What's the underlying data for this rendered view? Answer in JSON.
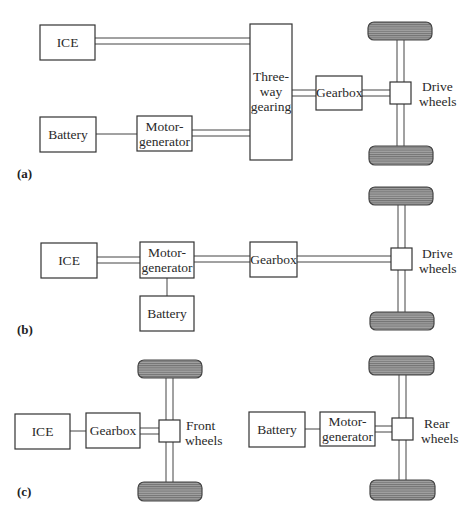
{
  "figure": {
    "panels": [
      {
        "id": "a",
        "label": "(a)",
        "components": {
          "ice": "ICE",
          "battery": "Battery",
          "motor_generator": [
            "Motor-",
            "generator"
          ],
          "three_way_gearing": [
            "Three-",
            "way",
            "gearing"
          ],
          "gearbox": "Gearbox",
          "drive_wheels": [
            "Drive",
            "wheels"
          ]
        },
        "connections": [
          {
            "from": "ICE",
            "to": "Three-way gearing",
            "type": "mechanical (double line)"
          },
          {
            "from": "Battery",
            "to": "Motor-generator",
            "type": "electrical (single line)"
          },
          {
            "from": "Motor-generator",
            "to": "Three-way gearing",
            "type": "mechanical (double line)"
          },
          {
            "from": "Three-way gearing",
            "to": "Gearbox",
            "type": "mechanical (double line)"
          },
          {
            "from": "Gearbox",
            "to": "Drive wheels",
            "type": "mechanical (double line)"
          }
        ]
      },
      {
        "id": "b",
        "label": "(b)",
        "components": {
          "ice": "ICE",
          "motor_generator": [
            "Motor-",
            "generator"
          ],
          "battery": "Battery",
          "gearbox": "Gearbox",
          "drive_wheels": [
            "Drive",
            "wheels"
          ]
        },
        "connections": [
          {
            "from": "ICE",
            "to": "Motor-generator",
            "type": "mechanical (double line)"
          },
          {
            "from": "Motor-generator",
            "to": "Battery",
            "type": "electrical (single line)"
          },
          {
            "from": "Motor-generator",
            "to": "Gearbox",
            "type": "mechanical (double line)"
          },
          {
            "from": "Gearbox",
            "to": "Drive wheels",
            "type": "mechanical (double line)"
          }
        ]
      },
      {
        "id": "c",
        "label": "(c)",
        "components": {
          "ice": "ICE",
          "gearbox": "Gearbox",
          "front_wheels": [
            "Front",
            "wheels"
          ],
          "battery": "Battery",
          "motor_generator": [
            "Motor-",
            "generator"
          ],
          "rear_wheels": [
            "Rear",
            "wheels"
          ]
        },
        "connections": [
          {
            "from": "ICE",
            "to": "Gearbox",
            "type": "single line"
          },
          {
            "from": "Gearbox",
            "to": "Front wheels",
            "type": "mechanical (double line)"
          },
          {
            "from": "Battery",
            "to": "Motor-generator",
            "type": "electrical (single line)"
          },
          {
            "from": "Motor-generator",
            "to": "Rear wheels",
            "type": "mechanical (double line)"
          }
        ]
      }
    ],
    "colors": {
      "wheel_fill": "#8a8a8a",
      "stroke": "#333333",
      "background": "#ffffff"
    }
  }
}
